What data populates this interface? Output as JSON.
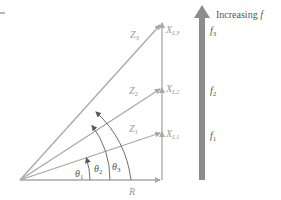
{
  "diagram": {
    "type": "impedance-phasor-diagram",
    "colors": {
      "line": "#a8a8a8",
      "arc": "#6e6e6e",
      "thick_arrow": "#8c8c8c",
      "label_light": "#9a9a9a",
      "label_dark": "#555555"
    },
    "resistance_label": "R",
    "impedances": [
      {
        "label": "Z",
        "sub": "1"
      },
      {
        "label": "Z",
        "sub": "2"
      },
      {
        "label": "Z",
        "sub": "3"
      }
    ],
    "reactances": [
      {
        "label": "X",
        "sub": "L1"
      },
      {
        "label": "X",
        "sub": "L2"
      },
      {
        "label": "X",
        "sub": "L3"
      }
    ],
    "angles": [
      {
        "label": "θ",
        "sub": "1"
      },
      {
        "label": "θ",
        "sub": "2"
      },
      {
        "label": "θ",
        "sub": "3"
      }
    ],
    "frequency_arrow": {
      "caption_prefix": "Increasing ",
      "caption_var": "f",
      "levels": [
        {
          "label": "f",
          "sub": "3"
        },
        {
          "label": "f",
          "sub": "2"
        },
        {
          "label": "f",
          "sub": "1"
        }
      ]
    }
  }
}
